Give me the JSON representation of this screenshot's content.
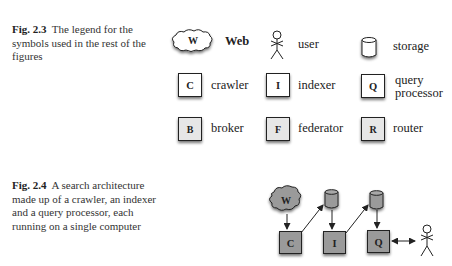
{
  "figures": [
    {
      "number": "Fig. 2.3",
      "caption": "The legend for the symbols used in the rest of the figures",
      "legend": [
        {
          "symbol": "cloud",
          "letter": "W",
          "label": "Web"
        },
        {
          "symbol": "stick-figure",
          "letter": "",
          "label": "user"
        },
        {
          "symbol": "cylinder",
          "letter": "",
          "label": "storage"
        },
        {
          "symbol": "box-white",
          "letter": "C",
          "label": "crawler"
        },
        {
          "symbol": "box-white",
          "letter": "I",
          "label": "indexer"
        },
        {
          "symbol": "box-white",
          "letter": "Q",
          "label_line1": "query",
          "label_line2": "processor"
        },
        {
          "symbol": "box-gray",
          "letter": "B",
          "label": "broker"
        },
        {
          "symbol": "box-gray",
          "letter": "F",
          "label": "federator"
        },
        {
          "symbol": "box-gray",
          "letter": "R",
          "label": "router"
        }
      ]
    },
    {
      "number": "Fig. 2.4",
      "caption": "A search architecture made up of a crawler, an indexer and a query processor, each running on a single computer",
      "nodes": {
        "web": "W",
        "crawler": "C",
        "indexer": "I",
        "query_processor": "Q"
      },
      "edges": [
        "W -> C",
        "C -> storage1",
        "storage1 -> I",
        "I -> storage2",
        "storage2 -> Q",
        "Q <-> user"
      ]
    }
  ],
  "colors": {
    "box_white": "#ffffff",
    "box_light_gray": "#e6e6e6",
    "box_dark_gray": "#9a9a9a",
    "stroke": "#222222"
  }
}
